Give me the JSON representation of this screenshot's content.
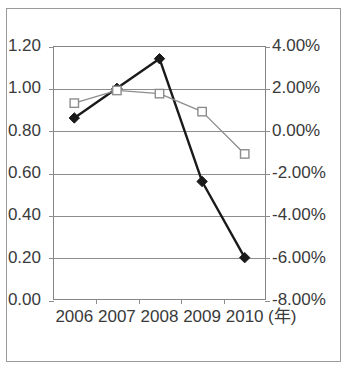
{
  "top_clipped_text": "―――",
  "chart_data": {
    "type": "line",
    "title": "",
    "xlabel": "(年)",
    "ylabel": "",
    "categories": [
      "2006",
      "2007",
      "2008",
      "2009",
      "2010"
    ],
    "x_unit": "(年)",
    "grid": true,
    "legend": "none",
    "axes": {
      "left": {
        "ylim": [
          0.0,
          1.2
        ],
        "tick_step": 0.2,
        "ticks": [
          "0.00",
          "0.20",
          "0.40",
          "0.60",
          "0.80",
          "1.00",
          "1.20"
        ],
        "tick_values": [
          0.0,
          0.2,
          0.4,
          0.6,
          0.8,
          1.0,
          1.2
        ]
      },
      "right": {
        "ylim": [
          -8.0,
          4.0
        ],
        "tick_step": 2.0,
        "ticks": [
          "-8.00%",
          "-6.00%",
          "-4.00%",
          "-2.00%",
          "0.00%",
          "2.00%",
          "4.00%"
        ],
        "tick_values": [
          -8.0,
          -6.0,
          -4.0,
          -2.0,
          0.0,
          2.0,
          4.0
        ]
      }
    },
    "series": [
      {
        "name": "series-diamond",
        "axis": "left",
        "marker": "filled-diamond",
        "color": "#1a1a1a",
        "line_width": 2.4,
        "values": [
          0.86,
          1.0,
          1.14,
          0.56,
          0.2
        ]
      },
      {
        "name": "series-square",
        "axis": "right",
        "marker": "open-square",
        "color": "#8d8d8d",
        "line_width": 1.3,
        "values": [
          1.3,
          1.9,
          1.75,
          0.9,
          -1.1
        ]
      }
    ]
  },
  "colors": {
    "frame": "#9a9a9a",
    "plot_border": "#858585",
    "grid": "#8d8d8d",
    "text": "#3a3a3a",
    "series_primary": "#1a1a1a",
    "series_secondary": "#8d8d8d",
    "background": "#ffffff"
  }
}
